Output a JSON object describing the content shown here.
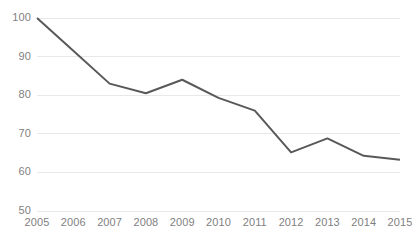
{
  "chart_data": {
    "type": "line",
    "title": "",
    "xlabel": "",
    "ylabel": "",
    "categories": [
      "2005",
      "2006",
      "2007",
      "2008",
      "2009",
      "2010",
      "2011",
      "2012",
      "2013",
      "2014",
      "2015"
    ],
    "values": [
      100,
      91.5,
      83,
      80.5,
      84,
      79.3,
      76,
      65.2,
      68.8,
      64.3,
      63.3
    ],
    "series": [
      {
        "name": "Index",
        "values": [
          100,
          91.5,
          83,
          80.5,
          84,
          79.3,
          76,
          65.2,
          68.8,
          64.3,
          63.3
        ],
        "color": "#595959"
      }
    ],
    "ylim": [
      50,
      100
    ],
    "yticks": [
      50,
      60,
      70,
      80,
      90,
      100
    ],
    "ytick_labels": [
      "50",
      "60",
      "70",
      "80",
      "90",
      "100"
    ],
    "xlim": [
      "2005",
      "2015"
    ],
    "grid": true,
    "grid_axis": "y",
    "grid_color": "#e8e8e8",
    "legend": false,
    "legend_position": "none",
    "line_color": "#595959",
    "line_width": 2,
    "markers": false,
    "background_color": "#ffffff",
    "tick_label_color": "#7f7f7f"
  }
}
